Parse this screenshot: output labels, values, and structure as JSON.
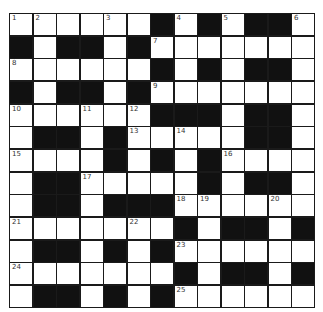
{
  "puzzle": {
    "rows": 13,
    "cols": 13,
    "colors": {
      "block": "#111111",
      "cell": "#ffffff",
      "line": "#1a1a1a"
    },
    "grid": [
      "WWWWWWBWBWBBW",
      "BWBBWBWWWWWWW",
      "WWWWWWBWBWBBW",
      "BWBBWBWWWWWWW",
      "WWWWWWBBBWBBW",
      "WBBWBWWWWWBBW",
      "WWWWBWBWBWWWW",
      "WBBWWWWWBWBBW",
      "WBBWBBBWWWWWW",
      "WWWWWWWBWBBWB",
      "WBBWBWBWWWWWW",
      "WWWWWWWBWBBWB",
      "WBBWBWBWWWWWW"
    ],
    "numbers": [
      {
        "r": 0,
        "c": 0,
        "n": "1"
      },
      {
        "r": 0,
        "c": 1,
        "n": "2"
      },
      {
        "r": 0,
        "c": 4,
        "n": "3"
      },
      {
        "r": 0,
        "c": 7,
        "n": "4"
      },
      {
        "r": 0,
        "c": 9,
        "n": "5"
      },
      {
        "r": 0,
        "c": 12,
        "n": "6"
      },
      {
        "r": 1,
        "c": 6,
        "n": "7"
      },
      {
        "r": 2,
        "c": 0,
        "n": "8"
      },
      {
        "r": 3,
        "c": 6,
        "n": "9"
      },
      {
        "r": 4,
        "c": 0,
        "n": "10"
      },
      {
        "r": 4,
        "c": 3,
        "n": "11"
      },
      {
        "r": 4,
        "c": 5,
        "n": "12"
      },
      {
        "r": 5,
        "c": 5,
        "n": "13"
      },
      {
        "r": 5,
        "c": 7,
        "n": "14"
      },
      {
        "r": 6,
        "c": 0,
        "n": "15"
      },
      {
        "r": 6,
        "c": 9,
        "n": "16"
      },
      {
        "r": 7,
        "c": 3,
        "n": "17"
      },
      {
        "r": 8,
        "c": 7,
        "n": "18"
      },
      {
        "r": 8,
        "c": 8,
        "n": "19"
      },
      {
        "r": 8,
        "c": 11,
        "n": "20"
      },
      {
        "r": 9,
        "c": 0,
        "n": "21"
      },
      {
        "r": 9,
        "c": 5,
        "n": "22"
      },
      {
        "r": 10,
        "c": 7,
        "n": "23"
      },
      {
        "r": 11,
        "c": 0,
        "n": "24"
      },
      {
        "r": 12,
        "c": 7,
        "n": "25"
      }
    ]
  }
}
